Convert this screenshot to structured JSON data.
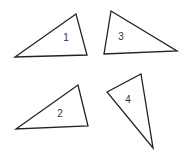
{
  "diagram": {
    "background": "#ffffff",
    "stroke_color": "#222222",
    "triangles": [
      {
        "label": "1",
        "points": "15,57 76,14 87,55",
        "label_x": 66,
        "label_y": 38
      },
      {
        "label": "3",
        "points": "111,11 104,54 177,51",
        "label_x": 121,
        "label_y": 37
      },
      {
        "label": "2",
        "points": "16,129 78,85 88,126",
        "label_x": 60,
        "label_y": 114
      },
      {
        "label": "4",
        "points": "107,92 141,74 153,148",
        "label_x": 128,
        "label_y": 100
      }
    ]
  }
}
